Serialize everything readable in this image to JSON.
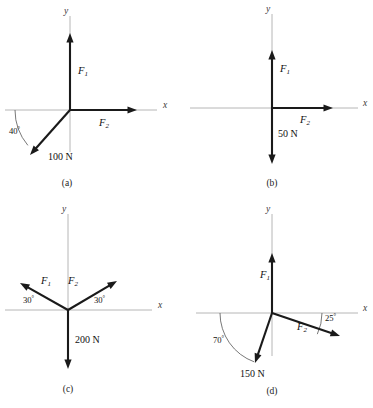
{
  "figure": {
    "background_color": "#ffffff",
    "axis_color": "#b6b6b6",
    "vector_color": "#1a1a1a",
    "arc_color": "#555555",
    "axis_labels": {
      "x": "x",
      "y": "y"
    },
    "panels": [
      {
        "id": "a",
        "caption": "(a)",
        "caption_pos": {
          "x": 67,
          "y": 186
        },
        "origin": {
          "x": 70,
          "y": 110
        },
        "axes": {
          "x": {
            "x1": 5,
            "y1": 110,
            "x2": 157,
            "y2": 110,
            "label_pos": {
              "x": 163,
              "y": 108
            }
          },
          "y": {
            "x1": 70,
            "y1": 152,
            "x2": 70,
            "y2": 16,
            "label_pos": {
              "x": 64,
              "y": 14
            }
          }
        },
        "vectors": [
          {
            "name": "F1",
            "label": "F",
            "subscript": "1",
            "label_pos": {
              "x": 78,
              "y": 74
            },
            "tip": {
              "x": 70,
              "y": 33
            },
            "magnitude": null
          },
          {
            "name": "F2",
            "label": "F",
            "subscript": "2",
            "label_pos": {
              "x": 99,
              "y": 126
            },
            "tip": {
              "x": 137,
              "y": 110
            },
            "magnitude": null
          },
          {
            "name": "F3",
            "label": null,
            "subscript": null,
            "label_pos": null,
            "tip": {
              "x": 30,
              "y": 155
            },
            "magnitude": "100 N",
            "magnitude_pos": {
              "x": 48,
              "y": 160
            }
          }
        ],
        "angles": [
          {
            "name": "angle-40",
            "value": "40",
            "unit": "°",
            "label_pos": {
              "x": 9,
              "y": 134
            },
            "arc": {
              "cx": 70,
              "cy": 110,
              "r": 55,
              "start_deg": 180,
              "end_deg": 220
            }
          }
        ]
      },
      {
        "id": "b",
        "caption": "(b)",
        "caption_pos": {
          "x": 272,
          "y": 186
        },
        "origin": {
          "x": 272,
          "y": 108
        },
        "axes": {
          "x": {
            "x1": 190,
            "y1": 108,
            "x2": 358,
            "y2": 108,
            "label_pos": {
              "x": 363,
              "y": 106
            }
          },
          "y": {
            "x1": 272,
            "y1": 150,
            "x2": 272,
            "y2": 14,
            "label_pos": {
              "x": 266,
              "y": 12
            }
          }
        },
        "vectors": [
          {
            "name": "F1",
            "label": "F",
            "subscript": "1",
            "label_pos": {
              "x": 280,
              "y": 72
            },
            "tip": {
              "x": 272,
              "y": 50
            },
            "magnitude": null
          },
          {
            "name": "F2",
            "label": "F",
            "subscript": "2",
            "label_pos": {
              "x": 300,
              "y": 123
            },
            "tip": {
              "x": 333,
              "y": 108
            },
            "magnitude": null
          },
          {
            "name": "F3",
            "label": null,
            "subscript": null,
            "label_pos": null,
            "tip": {
              "x": 272,
              "y": 164
            },
            "magnitude": "50 N",
            "magnitude_pos": {
              "x": 278,
              "y": 137
            }
          }
        ],
        "angles": []
      },
      {
        "id": "c",
        "caption": "(c)",
        "caption_pos": {
          "x": 68,
          "y": 392
        },
        "origin": {
          "x": 68,
          "y": 310
        },
        "axes": {
          "x": {
            "x1": 5,
            "y1": 310,
            "x2": 152,
            "y2": 310,
            "label_pos": {
              "x": 158,
              "y": 308
            }
          },
          "y": {
            "x1": 68,
            "y1": 352,
            "x2": 68,
            "y2": 214,
            "label_pos": {
              "x": 62,
              "y": 212
            }
          }
        },
        "vectors": [
          {
            "name": "F1",
            "label": "F",
            "subscript": "1",
            "label_pos": {
              "x": 41,
              "y": 284
            },
            "tip": {
              "x": 20,
              "y": 283
            },
            "magnitude": null
          },
          {
            "name": "F2",
            "label": "F",
            "subscript": "2",
            "label_pos": {
              "x": 68,
              "y": 284
            },
            "tip": {
              "x": 117,
              "y": 281
            },
            "magnitude": null
          },
          {
            "name": "F3",
            "label": null,
            "subscript": null,
            "label_pos": null,
            "tip": {
              "x": 68,
              "y": 369
            },
            "magnitude": "200 N",
            "magnitude_pos": {
              "x": 75,
              "y": 343
            }
          }
        ],
        "angles": [
          {
            "name": "angle-30-left",
            "value": "30",
            "unit": "°",
            "label_pos": {
              "x": 23,
              "y": 303
            },
            "arc": null
          },
          {
            "name": "angle-30-right",
            "value": "30",
            "unit": "°",
            "label_pos": {
              "x": 94,
              "y": 303
            },
            "arc": null
          }
        ]
      },
      {
        "id": "d",
        "caption": "(d)",
        "caption_pos": {
          "x": 272,
          "y": 394
        },
        "origin": {
          "x": 272,
          "y": 313
        },
        "axes": {
          "x": {
            "x1": 196,
            "y1": 313,
            "x2": 358,
            "y2": 313,
            "label_pos": {
              "x": 363,
              "y": 311
            }
          },
          "y": {
            "x1": 272,
            "y1": 356,
            "x2": 272,
            "y2": 214,
            "label_pos": {
              "x": 266,
              "y": 212
            }
          }
        },
        "vectors": [
          {
            "name": "F1",
            "label": "F",
            "subscript": "1",
            "label_pos": {
              "x": 260,
              "y": 278
            },
            "tip": {
              "x": 272,
              "y": 253
            },
            "magnitude": null
          },
          {
            "name": "F2",
            "label": "F",
            "subscript": "2",
            "label_pos": {
              "x": 297,
              "y": 330
            },
            "tip": {
              "x": 340,
              "y": 336
            },
            "magnitude": null
          },
          {
            "name": "F3",
            "label": null,
            "subscript": null,
            "label_pos": null,
            "tip": {
              "x": 255,
              "y": 363
            },
            "magnitude": "150 N",
            "magnitude_pos": {
              "x": 240,
              "y": 377
            }
          }
        ],
        "angles": [
          {
            "name": "angle-70",
            "value": "70",
            "unit": "°",
            "label_pos": {
              "x": 213,
              "y": 343
            },
            "arc": {
              "cx": 272,
              "cy": 313,
              "r": 52,
              "start_deg": 180,
              "end_deg": 250
            }
          },
          {
            "name": "angle-25",
            "value": "25",
            "unit": "°",
            "label_pos": {
              "x": 325,
              "y": 321
            },
            "arc": {
              "cx": 272,
              "cy": 313,
              "r": 50,
              "start_deg": 0,
              "end_deg": -25
            }
          }
        ]
      }
    ]
  }
}
